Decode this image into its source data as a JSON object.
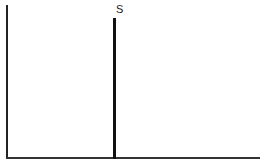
{
  "diagram": {
    "type": "economics-supply-diagram",
    "labels": {
      "supply_curve": "S"
    },
    "elements": {
      "y_axis": {
        "label": ""
      },
      "x_axis": {
        "label": ""
      },
      "supply_curve": {
        "orientation": "vertical",
        "label": "S"
      }
    },
    "colors": {
      "background": "#ffffff",
      "lines": "#111111"
    }
  }
}
